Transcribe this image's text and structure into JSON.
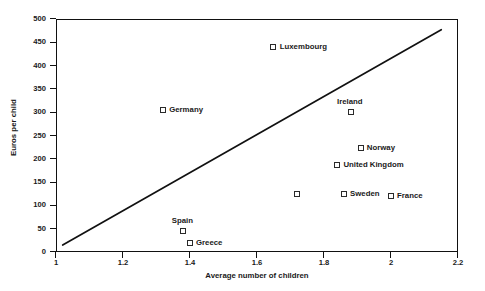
{
  "chart_data": {
    "type": "scatter",
    "title": "",
    "xlabel": "Average number of children",
    "ylabel": "Euros per child",
    "xlim": [
      1,
      2.2
    ],
    "ylim": [
      0,
      500
    ],
    "xticks": [
      "1",
      "1.2",
      "1.4",
      "1.6",
      "1.8",
      "2",
      "2.2"
    ],
    "xtick_values": [
      1,
      1.2,
      1.4,
      1.6,
      1.8,
      2,
      2.2
    ],
    "yticks": [
      "0",
      "50",
      "100",
      "150",
      "200",
      "250",
      "300",
      "350",
      "400",
      "450",
      "500"
    ],
    "ytick_values": [
      0,
      50,
      100,
      150,
      200,
      250,
      300,
      350,
      400,
      450,
      500
    ],
    "grid": false,
    "legend": "none",
    "marker_style": "open-square",
    "marker_color": "#2a2a2a",
    "line_color": "#111111",
    "points": [
      {
        "label": "Luxembourg",
        "x": 1.65,
        "y": 440,
        "label_side": "right"
      },
      {
        "label": "Germany",
        "x": 1.32,
        "y": 305,
        "label_side": "right"
      },
      {
        "label": "Ireland",
        "x": 1.88,
        "y": 300,
        "label_side": "above"
      },
      {
        "label": "Norway",
        "x": 1.91,
        "y": 223,
        "label_side": "right"
      },
      {
        "label": "United Kingdom",
        "x": 1.84,
        "y": 187,
        "label_side": "right"
      },
      {
        "label": "The Netherlands",
        "x": 1.72,
        "y": 124,
        "label_side": "left"
      },
      {
        "label": "Sweden",
        "x": 1.86,
        "y": 124,
        "label_side": "right"
      },
      {
        "label": "France",
        "x": 2.0,
        "y": 120,
        "label_side": "right"
      },
      {
        "label": "Spain",
        "x": 1.38,
        "y": 45,
        "label_side": "above"
      },
      {
        "label": "Greece",
        "x": 1.4,
        "y": 19,
        "label_side": "right"
      }
    ],
    "trend_line": {
      "x_start": 1.02,
      "y_start": 15,
      "x_end": 2.15,
      "y_end": 477
    }
  }
}
